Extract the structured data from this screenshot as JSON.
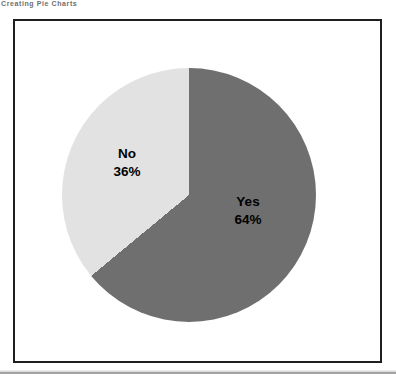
{
  "header": {
    "text": "Creating Pie Charts"
  },
  "colors": {
    "frame_border": "#1f1f1f",
    "background": "#ffffff",
    "divider": "#8f8f8f",
    "label_text": "#000000"
  },
  "chart_data": {
    "type": "pie",
    "title": "",
    "categories": [
      "Yes",
      "No"
    ],
    "values": [
      64,
      36
    ],
    "slices": [
      {
        "label": "Yes",
        "value": 64,
        "display": "64%",
        "color": "#6f6f6f"
      },
      {
        "label": "No",
        "value": 36,
        "display": "36%",
        "color": "#e2e2e2"
      }
    ],
    "start_angle_deg": 0,
    "direction": "clockwise",
    "legend": "none",
    "labels_position": "inside",
    "unit": "%"
  }
}
